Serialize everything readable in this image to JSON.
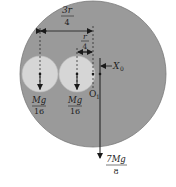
{
  "diagram": {
    "colors": {
      "disc": "#9a9a9a",
      "holes": "#d6d6d6",
      "lines": "#1a1a1a",
      "background": "#ffffff"
    },
    "dimensions": {
      "outer": {
        "numerator": "3r",
        "denominator": "4"
      },
      "inner": {
        "numerator": "r",
        "denominator": "4"
      }
    },
    "labels": {
      "x0": "X",
      "x0_sub": "0",
      "o1": "O",
      "o1_sub": "1"
    },
    "forces": {
      "left_hole": {
        "numerator": "Mg",
        "denominator": "16"
      },
      "right_hole": {
        "numerator": "Mg",
        "denominator": "16"
      },
      "disc": {
        "numerator": "7Mg",
        "denominator": "8"
      }
    }
  }
}
